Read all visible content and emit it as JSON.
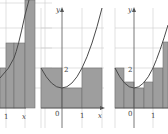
{
  "figures": [
    {
      "id": "panel-1",
      "function": "x^2 + 1",
      "interval": [
        -1,
        2
      ],
      "rectangles": [
        {
          "x0": 0,
          "x1": 1,
          "height": 2
        },
        {
          "x0": 1,
          "x1": 2,
          "height": 5
        }
      ],
      "tick_labels": {
        "x": [
          "1",
          "x"
        ]
      },
      "cropped": true
    },
    {
      "id": "panel-2",
      "function": "x^2 + 1",
      "interval": [
        -1,
        2
      ],
      "rectangles": [
        {
          "x0": -1,
          "x1": 0,
          "height": 2
        },
        {
          "x0": 0,
          "x1": 1,
          "height": 1
        },
        {
          "x0": 1,
          "x1": 2,
          "height": 2
        }
      ],
      "tick_labels": {
        "y_axis": "y",
        "y_two": "2",
        "origin": "0",
        "x_one": "1",
        "x_axis": "x"
      }
    },
    {
      "id": "panel-3",
      "function": "x^2 + 1",
      "interval": [
        -1,
        2
      ],
      "rectangles": [
        {
          "x0": -1,
          "x1": -0.5,
          "height": 2
        },
        {
          "x0": -0.5,
          "x1": 0,
          "height": 1.25
        },
        {
          "x0": 0,
          "x1": 0.5,
          "height": 1
        },
        {
          "x0": 0.5,
          "x1": 1,
          "height": 1.25
        },
        {
          "x0": 1,
          "x1": 1.5,
          "height": 2
        },
        {
          "x0": 1.5,
          "x1": 2,
          "height": 3.25
        }
      ],
      "tick_labels": {
        "y_axis": "y",
        "y_two": "2",
        "origin": "0",
        "x_one": "1"
      }
    }
  ]
}
